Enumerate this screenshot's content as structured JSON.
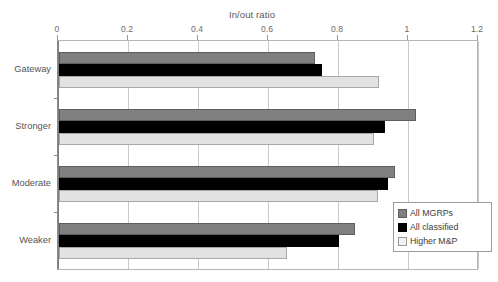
{
  "chart_data": {
    "type": "bar",
    "orientation": "horizontal",
    "title": "In/out ratio",
    "xlabel": "",
    "ylabel": "",
    "xlim": [
      0,
      1.2
    ],
    "xticks": [
      0,
      0.2,
      0.4,
      0.6,
      0.8,
      1,
      1.2
    ],
    "xtick_labels": [
      "0",
      "0.2",
      "0.4",
      "0.6",
      "0.8",
      "1",
      "1.2"
    ],
    "grid": true,
    "grid_axis": "x",
    "legend_position": "inside-bottom-right",
    "categories": [
      "Gateway",
      "Stronger",
      "Moderate",
      "Weaker"
    ],
    "series": [
      {
        "name": "All MGRPs",
        "color": "#808080",
        "values": [
          0.73,
          1.02,
          0.96,
          0.845
        ]
      },
      {
        "name": "All classified",
        "color": "#000000",
        "values": [
          0.75,
          0.93,
          0.94,
          0.8
        ]
      },
      {
        "name": "Higher M&P",
        "color": "#e2e2e2",
        "values": [
          0.915,
          0.9,
          0.91,
          0.65
        ]
      }
    ]
  },
  "legend": {
    "items": [
      {
        "label": "All MGRPs"
      },
      {
        "label": "All classified"
      },
      {
        "label": "Higher M&P"
      }
    ]
  },
  "colors": {
    "series_all_mgrps": "#808080",
    "series_all_classified": "#000000",
    "series_higher_mp": "#e2e2e2",
    "grid": "#c9c9c9",
    "axis": "#8a8a8a",
    "text": "#595959",
    "background": "#ffffff"
  }
}
